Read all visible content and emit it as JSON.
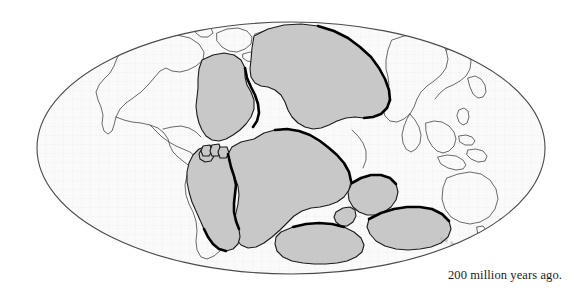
{
  "figure": {
    "projection": "elliptical-mollweide",
    "caption": "200 million years ago.",
    "signature": "C.R. Scotese",
    "colors": {
      "background": "#ffffff",
      "ocean_fill": "#fafafa",
      "graticule": "#ededed",
      "land_fill": "#c8c8c8",
      "land_outline": "#1a1a1a",
      "modern_coastline": "#3a3a3a",
      "plate_margin_emphasis": "#000000",
      "globe_outline": "#4a4a4a",
      "caption_text": "#1a1a1a"
    },
    "globe": {
      "center_x": 291,
      "center_y": 148,
      "radius_x": 254,
      "radius_y": 126
    },
    "landmasses": [
      {
        "name": "laurasia-north-america",
        "label": "Laurentia / North America block"
      },
      {
        "name": "laurasia-eurasia",
        "label": "Eurasia / Siberia block"
      },
      {
        "name": "gondwana-south-america",
        "label": "South America block"
      },
      {
        "name": "gondwana-africa",
        "label": "Africa block"
      },
      {
        "name": "gondwana-india",
        "label": "India block"
      },
      {
        "name": "gondwana-antarctica",
        "label": "Antarctica block"
      },
      {
        "name": "gondwana-australia",
        "label": "Australia block"
      },
      {
        "name": "microplate-fragments",
        "label": "Microplate fragments"
      }
    ],
    "reference_outlines": [
      {
        "name": "modern-north-america",
        "label": "Modern North America coastline"
      },
      {
        "name": "modern-south-america",
        "label": "Modern South America coastline"
      },
      {
        "name": "modern-asia",
        "label": "Modern Asia coastline"
      },
      {
        "name": "modern-australia",
        "label": "Modern Australia coastline"
      },
      {
        "name": "modern-southeast-asia-islands",
        "label": "Modern Southeast Asian islands"
      }
    ]
  }
}
